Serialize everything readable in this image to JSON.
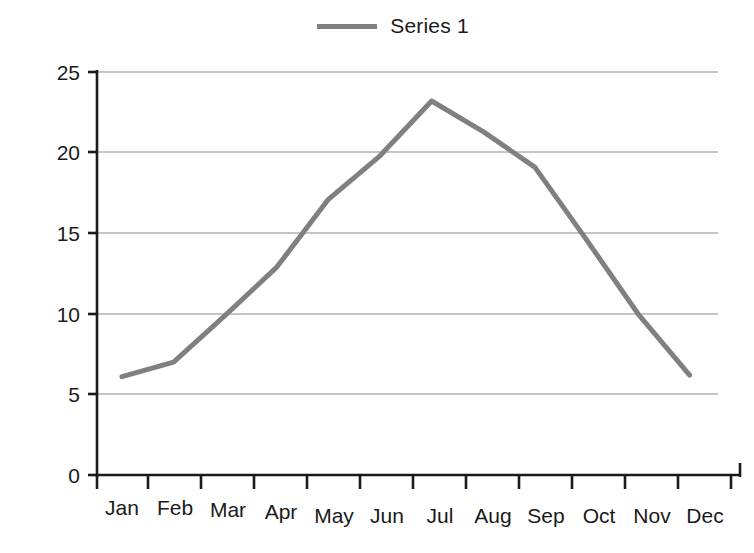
{
  "legend": {
    "position": "top-center",
    "entries": [
      {
        "label": "Series 1",
        "color": "#808080",
        "swatch": "line-swatch"
      }
    ]
  },
  "axes": {
    "y_ticks": [
      "0",
      "5",
      "10",
      "15",
      "20",
      "25"
    ],
    "x_ticks": [
      "Jan",
      "Feb",
      "Mar",
      "Apr",
      "May",
      "Jun",
      "Jul",
      "Aug",
      "Sep",
      "Oct",
      "Nov",
      "Dec"
    ]
  },
  "chart_data": {
    "type": "line",
    "title": "",
    "xlabel": "",
    "ylabel": "",
    "categories": [
      "Jan",
      "Feb",
      "Mar",
      "Apr",
      "May",
      "Jun",
      "Jul",
      "Aug",
      "Sep",
      "Oct",
      "Nov",
      "Dec"
    ],
    "series": [
      {
        "name": "Series 1",
        "color": "#808080",
        "values": [
          6.1,
          7.0,
          9.9,
          12.9,
          17.1,
          19.8,
          23.2,
          21.3,
          19.1,
          14.6,
          10.0,
          6.2
        ]
      }
    ],
    "ylim": [
      0,
      25
    ],
    "ytick_step": 5,
    "grid": "horizontal",
    "legend_position": "top-center",
    "markers": "none",
    "line_width": 5
  }
}
